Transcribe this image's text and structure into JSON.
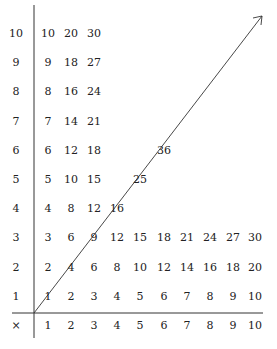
{
  "diagram": {
    "title": "",
    "corner_symbol": "×",
    "column_headers": [
      "1",
      "2",
      "3",
      "4",
      "5",
      "6",
      "7",
      "8",
      "9",
      "10"
    ],
    "row_headers": [
      "10",
      "9",
      "8",
      "7",
      "6",
      "5",
      "4",
      "3",
      "2",
      "1"
    ],
    "rows": [
      {
        "label": "10",
        "values": [
          "10",
          "20",
          "30"
        ]
      },
      {
        "label": "9",
        "values": [
          "9",
          "18",
          "27"
        ]
      },
      {
        "label": "8",
        "values": [
          "8",
          "16",
          "24"
        ]
      },
      {
        "label": "7",
        "values": [
          "7",
          "14",
          "21"
        ]
      },
      {
        "label": "6",
        "values": [
          "6",
          "12",
          "18",
          "",
          "",
          "36"
        ]
      },
      {
        "label": "5",
        "values": [
          "5",
          "10",
          "15",
          "",
          "25"
        ]
      },
      {
        "label": "4",
        "values": [
          "4",
          "8",
          "12",
          "16"
        ]
      },
      {
        "label": "3",
        "values": [
          "3",
          "6",
          "9",
          "12",
          "15",
          "18",
          "21",
          "24",
          "27",
          "30"
        ]
      },
      {
        "label": "2",
        "values": [
          "2",
          "4",
          "6",
          "8",
          "10",
          "12",
          "14",
          "16",
          "18",
          "20"
        ]
      },
      {
        "label": "1",
        "values": [
          "1",
          "2",
          "3",
          "4",
          "5",
          "6",
          "7",
          "8",
          "9",
          "10"
        ]
      }
    ],
    "diagonal_arrow": {
      "from": "origin",
      "to": "top-right",
      "meaning": "diagonal of squares 1,4,9,16,25,36"
    },
    "line_color": "#333333",
    "text_color": "#222222"
  }
}
